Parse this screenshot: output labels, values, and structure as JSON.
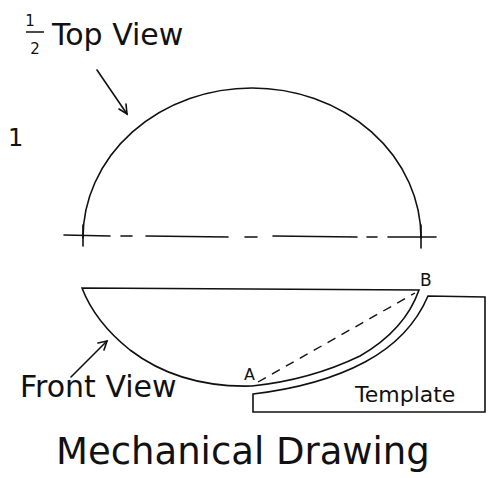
{
  "title": "Mechanical Drawing",
  "page_number": "1",
  "labels": {
    "half_numerator": "1",
    "half_denominator": "2",
    "top_view": "Top View",
    "front_view": "Front View",
    "template": "Template",
    "point_a": "A",
    "point_b": "B"
  },
  "colors": {
    "ink": "#111111",
    "background": "#ffffff"
  }
}
